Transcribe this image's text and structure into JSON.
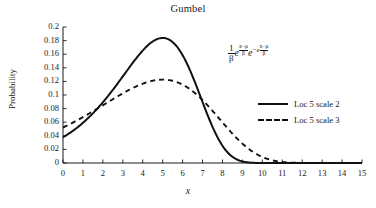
{
  "chart_data": {
    "type": "line",
    "title": "Gumbel",
    "xlabel": "x",
    "ylabel": "Probability",
    "xlim": [
      0,
      15
    ],
    "ylim": [
      0,
      0.2
    ],
    "grid": false,
    "legend_position": "right",
    "xticks": [
      "0",
      "1",
      "2",
      "3",
      "4",
      "5",
      "6",
      "7",
      "8",
      "9",
      "10",
      "11",
      "12",
      "13",
      "14",
      "15"
    ],
    "yticks": [
      "0",
      "0.02",
      "0.04",
      "0.06",
      "0.08",
      "0.1",
      "0.12",
      "0.14",
      "0.16",
      "0.18",
      "0.2"
    ],
    "annotation": "(1/β) e^((x−μ)/β) e^(−e^((x−μ)/β))",
    "x": [
      0,
      0.5,
      1,
      1.5,
      2,
      2.5,
      3,
      3.5,
      4,
      4.5,
      5,
      5.5,
      6,
      6.5,
      7,
      7.5,
      8,
      8.5,
      9,
      9.5,
      10,
      10.5,
      11,
      11.5,
      12,
      12.5,
      13,
      13.5,
      14,
      14.5,
      15
    ],
    "series": [
      {
        "name": "Loc 5 scale 2",
        "style": "solid",
        "color": "#111111",
        "loc": 5,
        "scale": 2,
        "values": [
          0.0384,
          0.0486,
          0.0603,
          0.0733,
          0.0874,
          0.102,
          0.1166,
          0.1306,
          0.1433,
          0.154,
          0.162,
          0.167,
          0.1685,
          0.1666,
          0.1614,
          0.1533,
          0.1428,
          0.1307,
          0.1176,
          0.1041,
          0.0908,
          0.0782,
          0.0665,
          0.056,
          0.0467,
          0.0387,
          0.0318,
          0.026,
          0.0211,
          0.0171,
          0.0138
        ]
      },
      {
        "name": "Loc 5 scale 3",
        "style": "dashed",
        "color": "#111111",
        "loc": 5,
        "scale": 3,
        "values": [
          0.053,
          0.0601,
          0.0673,
          0.0745,
          0.0815,
          0.0882,
          0.0944,
          0.1,
          0.1048,
          0.1088,
          0.1119,
          0.114,
          0.1152,
          0.1155,
          0.1148,
          0.1134,
          0.1112,
          0.1083,
          0.1048,
          0.1009,
          0.0965,
          0.0918,
          0.0869,
          0.0818,
          0.0766,
          0.0714,
          0.0663,
          0.0612,
          0.0563,
          0.0515,
          0.047
        ]
      }
    ]
  },
  "legend": {
    "items": [
      {
        "label": "Loc 5 scale 2",
        "style": "solid"
      },
      {
        "label": "Loc 5 scale 3",
        "style": "dashed"
      }
    ]
  },
  "formula": {
    "one": "1",
    "beta": "β",
    "e1": "e",
    "e2": "e",
    "minus_e": "−e",
    "num": "x−μ",
    "den": "β"
  }
}
